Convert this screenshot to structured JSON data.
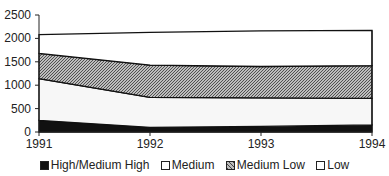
{
  "chart_data": {
    "type": "area",
    "stacked": true,
    "title": "",
    "xlabel": "",
    "ylabel": "",
    "categories": [
      "1991",
      "1992",
      "1993",
      "1994"
    ],
    "ylim": [
      0,
      2500
    ],
    "yticks": [
      "0",
      "500",
      "1000",
      "1500",
      "2000",
      "2500"
    ],
    "grid": false,
    "legend_position": "bottom",
    "series": [
      {
        "name": "High/Medium High",
        "values": [
          250,
          100,
          120,
          150
        ],
        "fill": "#111111"
      },
      {
        "name": "Medium",
        "values": [
          890,
          640,
          610,
          570
        ],
        "fill": "#f7f7f7"
      },
      {
        "name": "Medium Low",
        "values": [
          540,
          690,
          670,
          700
        ],
        "fill": "hatch"
      },
      {
        "name": "Low",
        "values": [
          400,
          700,
          760,
          750
        ],
        "fill": "#ffffff"
      }
    ]
  },
  "legend": {
    "items": [
      {
        "label": "High/Medium High"
      },
      {
        "label": "Medium"
      },
      {
        "label": "Medium Low"
      },
      {
        "label": "Low"
      }
    ]
  }
}
